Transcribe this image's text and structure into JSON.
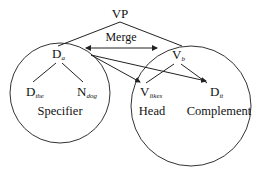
{
  "diagram": {
    "root": {
      "label": "VP"
    },
    "merge": {
      "label": "Merge"
    },
    "specifier": {
      "head_node": {
        "base": "D",
        "sub": "a"
      },
      "children": [
        {
          "base": "D",
          "sub": "the"
        },
        {
          "base": "N",
          "sub": "dog"
        }
      ],
      "label": "Specifier"
    },
    "verbal": {
      "head_node": {
        "base": "V",
        "sub": "b"
      },
      "children": [
        {
          "base": "V",
          "sub": "likes"
        },
        {
          "base": "D",
          "sub": "it"
        }
      ],
      "head_label": "Head",
      "complement_label": "Complement"
    },
    "arrows": [
      {
        "from": "D_a",
        "to": "V_likes"
      },
      {
        "from": "D_a",
        "to": "D_it"
      },
      {
        "from": "Merge",
        "to": "both",
        "type": "double-headed"
      }
    ]
  }
}
